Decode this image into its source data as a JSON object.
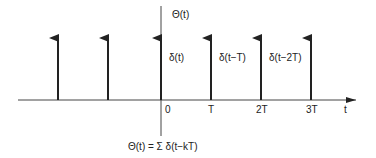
{
  "diagram": {
    "y_axis_label": "Θ(t)",
    "x_axis_label": "t",
    "formula": "Θ(t) = Σ δ(t−kT)",
    "ticks": [
      {
        "label": "0",
        "x": 165
      },
      {
        "label": "T",
        "x": 208
      },
      {
        "label": "2T",
        "x": 255
      },
      {
        "label": "3T",
        "x": 305
      }
    ],
    "impulses": [
      {
        "x": 58,
        "label": ""
      },
      {
        "x": 108,
        "label": ""
      },
      {
        "x": 161,
        "label": "δ(t)"
      },
      {
        "x": 211,
        "label": "δ(t−T)"
      },
      {
        "x": 261,
        "label": "δ(t−2T)"
      },
      {
        "x": 311,
        "label": ""
      }
    ],
    "colors": {
      "line": "#222222",
      "background": "#ffffff"
    }
  }
}
